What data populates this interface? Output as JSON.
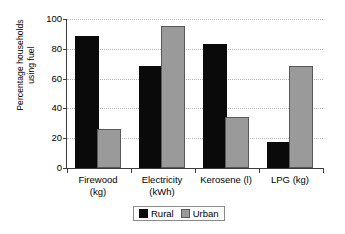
{
  "chart_data": {
    "type": "bar",
    "title": "",
    "xlabel": "",
    "ylabel": "Percentage households\nusing fuel",
    "ylim": [
      0,
      100
    ],
    "ytick_step": 20,
    "yticks": [
      "0",
      "20",
      "40",
      "60",
      "80",
      "100"
    ],
    "grid": "horizontal-dotted",
    "legend_position": "bottom-center",
    "categories": [
      "Firewood\n(kg)",
      "Electricity\n(kWh)",
      "Kerosene (l)",
      "LPG (kg)"
    ],
    "series": [
      {
        "name": "Rural",
        "color": "#0a0a0a",
        "values": [
          87,
          67,
          82,
          16
        ]
      },
      {
        "name": "Urban",
        "color": "#9a9a9a",
        "values": [
          25,
          94,
          33,
          67
        ]
      }
    ]
  },
  "legend": {
    "items": [
      {
        "label": "Rural",
        "swatch": "black-square-swatch"
      },
      {
        "label": "Urban",
        "swatch": "gray-square-swatch"
      }
    ]
  }
}
